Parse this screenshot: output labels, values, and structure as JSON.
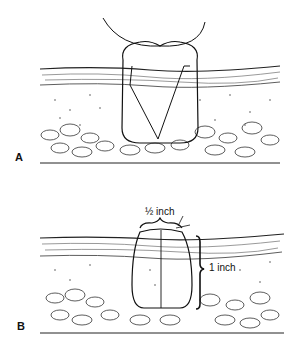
{
  "figure": {
    "panels": [
      {
        "label": "A",
        "description": "Figure-of-eight suture loop passing through skin layers around a V-shaped wound"
      },
      {
        "label": "B",
        "description": "Closed wound with suture loop; measurements indicated"
      }
    ],
    "measurements": {
      "width": "½ inch",
      "depth": "1 inch"
    }
  }
}
